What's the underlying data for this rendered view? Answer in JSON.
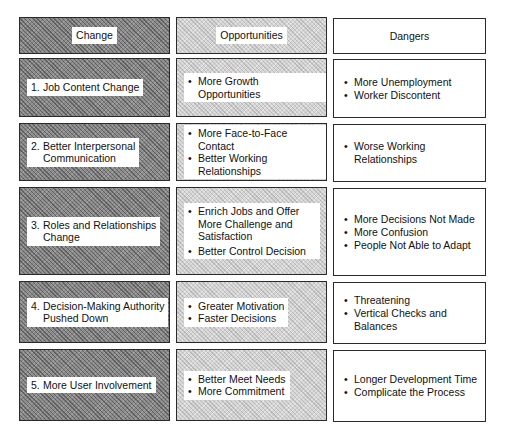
{
  "headers": {
    "change": "Change",
    "opportunities": "Opportunities",
    "dangers": "Dangers"
  },
  "rows": [
    {
      "change": {
        "num": "1.",
        "lines": [
          "Job Content Change"
        ]
      },
      "opportunities": [
        "More Growth Opportunities"
      ],
      "dangers": [
        "More Unemployment",
        "Worker Discontent"
      ]
    },
    {
      "change": {
        "num": "2.",
        "lines": [
          "Better Interpersonal",
          "Communication"
        ]
      },
      "opportunities": [
        "More Face-to-Face Contact",
        "Better Working Relationships"
      ],
      "dangers": [
        "Worse Working Relationships"
      ]
    },
    {
      "change": {
        "num": "3.",
        "lines": [
          "Roles and Relationships",
          "Change"
        ]
      },
      "opportunities": [
        "Enrich Jobs and Offer More Challenge and Satisfaction",
        "Better Control Decision"
      ],
      "dangers": [
        "More Decisions Not Made",
        "More Confusion",
        "People Not Able to Adapt"
      ]
    },
    {
      "change": {
        "num": "4.",
        "lines": [
          "Decision-Making Authority",
          "Pushed Down"
        ]
      },
      "opportunities": [
        "Greater Motivation",
        "Faster Decisions"
      ],
      "dangers": [
        "Threatening",
        "Vertical Checks and Balances"
      ]
    },
    {
      "change": {
        "num": "5.",
        "lines": [
          "More User Involvement"
        ]
      },
      "opportunities": [
        "Better Meet Needs",
        "More Commitment"
      ],
      "dangers": [
        "Longer Development Time",
        "Complicate the Process"
      ]
    }
  ],
  "colors": {
    "change_fill": "#8a8a8a",
    "opportunities_fill": "#d4d4d4",
    "dangers_fill": "#ffffff",
    "border": "#2a2a2a"
  }
}
